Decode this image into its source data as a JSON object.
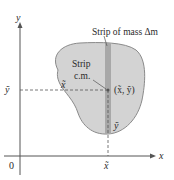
{
  "diagram": {
    "type": "center-of-mass-strip",
    "axes": {
      "x_label": "x",
      "y_label": "y",
      "origin_label": "0"
    },
    "labels": {
      "strip_title": "Strip of mass Δm",
      "strip_cm_line1": "Strip",
      "strip_cm_line2": "c.m.",
      "point": "(x̃, ỹ)",
      "x_tilde_inside": "x̃",
      "y_tilde_inside": "ỹ",
      "y_tilde_axis": "ỹ",
      "x_tilde_axis": "x̃"
    },
    "colors": {
      "region_fill": "#d3d3d3",
      "region_stroke": "#8a8a8a",
      "strip_fill": "#a8a8a8",
      "axis": "#555555",
      "dash": "#555555",
      "text": "#2a2a2a"
    }
  }
}
